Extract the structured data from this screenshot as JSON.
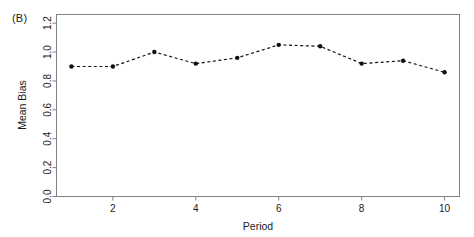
{
  "figure": {
    "panel_label": "(B)",
    "background_color": "#ffffff",
    "frame_color": "#808080",
    "series_color": "#111111"
  },
  "chart_data": {
    "type": "line",
    "title": "",
    "subtitle": "",
    "panel": "(B)",
    "xlabel": "Period",
    "ylabel": "Mean Bias",
    "x": [
      1,
      2,
      3,
      4,
      5,
      6,
      7,
      8,
      9,
      10
    ],
    "values": [
      0.9,
      0.9,
      1.0,
      0.92,
      0.96,
      1.05,
      1.04,
      0.92,
      0.94,
      0.86
    ],
    "series": [
      {
        "name": "Mean Bias",
        "values": [
          0.9,
          0.9,
          1.0,
          0.92,
          0.96,
          1.05,
          1.04,
          0.92,
          0.94,
          0.86
        ],
        "line_style": "dashed",
        "marker": "filled-circle",
        "color": "#111111"
      }
    ],
    "xlim": [
      0.64,
      10.36
    ],
    "ylim": [
      0.0,
      1.26
    ],
    "xticks": [
      2,
      4,
      6,
      8,
      10
    ],
    "xtick_labels": [
      "2",
      "4",
      "6",
      "8",
      "10"
    ],
    "yticks": [
      0.0,
      0.2,
      0.4,
      0.6,
      0.8,
      1.0,
      1.2
    ],
    "ytick_labels": [
      "0.0",
      "0.2",
      "0.4",
      "0.6",
      "0.8",
      "1.0",
      "1.2"
    ],
    "grid": false,
    "legend": null,
    "legend_position": "none",
    "annotations": []
  }
}
